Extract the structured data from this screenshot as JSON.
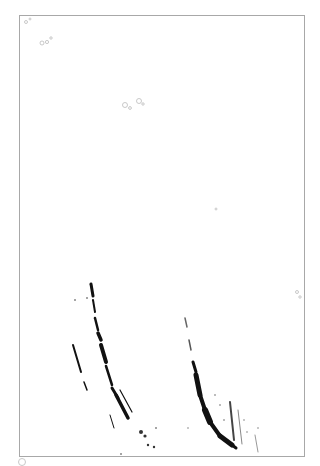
{
  "scan": {
    "width": 320,
    "height": 466,
    "frame": {
      "x": 19,
      "y": 15,
      "w": 286,
      "h": 442,
      "color": "#a8a8a8"
    },
    "ink_color": "#111111",
    "faint_color": "#b0b0b0"
  }
}
